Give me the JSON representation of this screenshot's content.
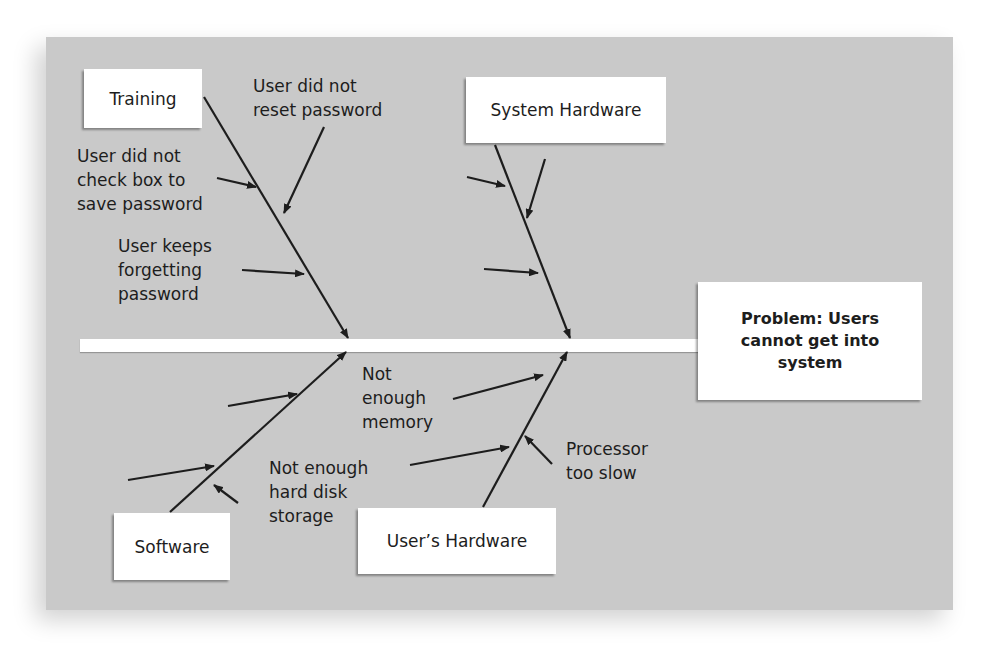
{
  "diagram": {
    "type": "fishbone",
    "problem": "Problem: Users cannot get into system",
    "problem_lines": [
      "Problem: Users",
      "cannot get into",
      "system"
    ],
    "categories": [
      {
        "name": "Training",
        "position": "top-left",
        "causes": [
          "User did not reset password",
          "User did not check box to save password",
          "User keeps forgetting password"
        ]
      },
      {
        "name": "System Hardware",
        "position": "top-right",
        "causes": []
      },
      {
        "name": "Software",
        "position": "bottom-left",
        "causes": []
      },
      {
        "name": "User's Hardware",
        "position": "bottom-right",
        "causes": [
          "Not enough memory",
          "Not enough hard disk storage",
          "Processor too slow"
        ]
      }
    ]
  },
  "labels": {
    "training": "Training",
    "system_hardware": "System Hardware",
    "software": "Software",
    "users_hardware": "User’s Hardware",
    "reset_password": "User did not\nreset password",
    "check_box": "User did not\ncheck box to\nsave password",
    "forgetting": "User keeps\nforgetting\npassword",
    "memory": "Not\nenough\nmemory",
    "hard_disk": "Not enough\nhard disk\nstorage",
    "processor": "Processor\ntoo slow"
  },
  "colors": {
    "panel": "#c9c9c9",
    "box": "#ffffff",
    "line": "#1d1d1d"
  }
}
